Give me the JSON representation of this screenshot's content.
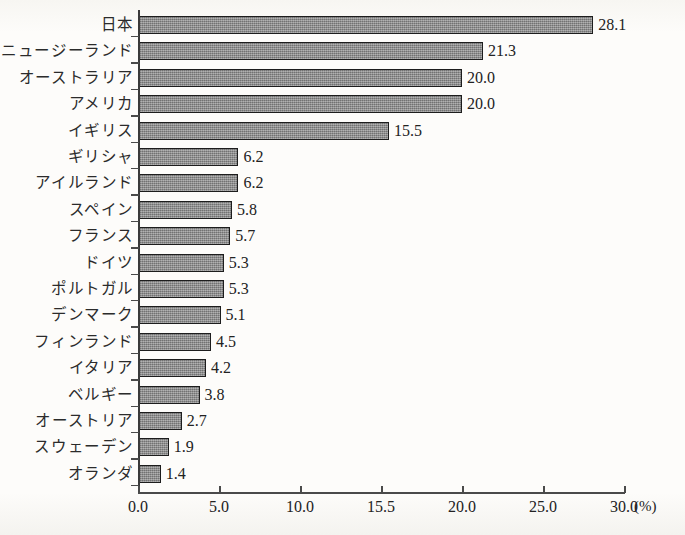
{
  "chart_data": {
    "type": "bar",
    "orientation": "horizontal",
    "title": "",
    "subtitle": "",
    "xlabel": "",
    "ylabel": "",
    "unit_label": "(%)",
    "xlim": [
      0.0,
      30.0
    ],
    "grid": false,
    "legend": null,
    "axis_origin_value": 0.0,
    "x_ticks": [
      {
        "value": 0.0,
        "label": "0.0"
      },
      {
        "value": 5.0,
        "label": "5.0"
      },
      {
        "value": 10.0,
        "label": "10.0"
      },
      {
        "value": 15.0,
        "label": "15.5"
      },
      {
        "value": 20.0,
        "label": "20.0"
      },
      {
        "value": 25.0,
        "label": "25.0"
      },
      {
        "value": 30.0,
        "label": "30.0"
      }
    ],
    "categories": [
      "日本",
      "ニュージーランド",
      "オーストラリア",
      "アメリカ",
      "イギリス",
      "ギリシャ",
      "アイルランド",
      "スペイン",
      "フランス",
      "ドイツ",
      "ポルトガル",
      "デンマーク",
      "フィンランド",
      "イタリア",
      "ベルギー",
      "オーストリア",
      "スウェーデン",
      "オランダ"
    ],
    "values": [
      28.1,
      21.3,
      20.0,
      20.0,
      15.5,
      6.2,
      6.2,
      5.8,
      5.7,
      5.3,
      5.3,
      5.1,
      4.5,
      4.2,
      3.8,
      2.7,
      1.9,
      1.4
    ],
    "value_labels": [
      "28.1",
      "21.3",
      "20.0",
      "20.0",
      "15.5",
      "6.2",
      "6.2",
      "5.8",
      "5.7",
      "5.3",
      "5.3",
      "5.1",
      "4.5",
      "4.2",
      "3.8",
      "2.7",
      "1.9",
      "1.4"
    ],
    "bar_color": "#8a8a8a",
    "bar_border_color": "#1d1d1d",
    "axis_color": "#4a4a4a",
    "background_color": "#fdfcfa",
    "text_color": "#222222"
  }
}
